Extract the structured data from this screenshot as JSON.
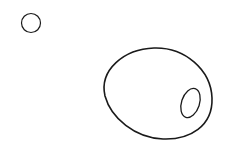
{
  "canvas": {
    "width": 236,
    "height": 168,
    "background": "#ffffff"
  },
  "style": {
    "stroke": "#1a1a1a"
  },
  "shapes": [
    {
      "name": "small-circle",
      "cx": 31,
      "cy": 23,
      "rx": 9.5,
      "ry": 9.5,
      "rotate": 0,
      "stroke_width": 1.2
    },
    {
      "name": "large-egg",
      "path": "M154,48 C185,47 211,70 212,98 C213,126 190,140 163,139 C135,138 111,118 105,96 C99,70 124,49 154,48 Z",
      "stroke_width": 1.6
    },
    {
      "name": "inner-ellipse",
      "cx": 190.5,
      "cy": 103,
      "rx": 9,
      "ry": 15,
      "rotate": 18,
      "stroke_width": 1.3
    }
  ]
}
